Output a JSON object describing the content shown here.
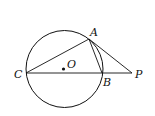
{
  "diagram": {
    "type": "geometry",
    "labels": {
      "A": "A",
      "B": "B",
      "C": "C",
      "O": "O",
      "P": "P"
    },
    "elements": [
      "circle O",
      "segment CB (diameter through B extended to P)",
      "segment CA",
      "segment AB",
      "segment AP (tangent)",
      "point O (center)"
    ]
  }
}
